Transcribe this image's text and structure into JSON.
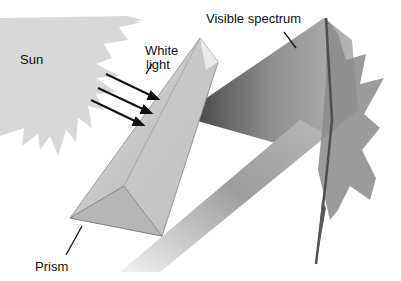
{
  "figure": {
    "type": "illustration",
    "labels": {
      "sun": "Sun",
      "white_light_line1": "White",
      "white_light_line2": "light",
      "visible_spectrum": "Visible spectrum",
      "prism": "Prism"
    },
    "colors": {
      "sun": "#d6d6d6",
      "prism_light": "#e4e4e4",
      "prism_dark": "#9a9a9a",
      "beam_light": "#cfcfcf",
      "beam_dark": "#6f6f6f",
      "leaf": "#7a7a7a",
      "arrow": "#111111"
    }
  }
}
